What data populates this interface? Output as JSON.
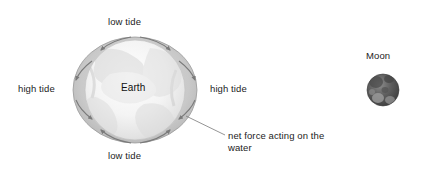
{
  "diagram": {
    "title_present": false,
    "labels": {
      "low_tide_top": "low tide",
      "low_tide_bottom": "low tide",
      "high_tide_left": "high tide",
      "high_tide_right": "high tide",
      "earth": "Earth",
      "moon": "Moon",
      "net_force": "net force acting on the water"
    },
    "bodies": [
      {
        "name": "Earth",
        "shape": "sphere",
        "center": [
          135,
          90
        ],
        "diameter": 100,
        "fill": "#f2f2f2"
      },
      {
        "name": "Moon",
        "shape": "sphere",
        "center": [
          383,
          90
        ],
        "diameter": 32,
        "fill": "#5a5a5a"
      }
    ],
    "water_envelope": {
      "shape": "ellipse",
      "center": [
        135,
        90
      ],
      "radius_x": 62,
      "radius_y": 53,
      "stroke": "#9a9a9a",
      "fill": "#c9c9c9",
      "description": "tidal bulge ellipse elongated along the Earth-Moon line"
    },
    "force_arrows": {
      "count": 8,
      "color": "#7a7a7a",
      "description": "arrows along the water envelope converging toward the two high-tide bulges"
    },
    "leader_line": {
      "from": [
        186,
        116
      ],
      "to": [
        225,
        135
      ],
      "color": "#7a7a7a"
    },
    "colors": {
      "text": "#1c1c1c",
      "arrow": "#7a7a7a",
      "water": "#c9c9c9",
      "earth": "#f2f2f2",
      "moon": "#5a5a5a",
      "background": "#ffffff"
    }
  }
}
